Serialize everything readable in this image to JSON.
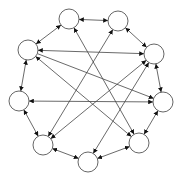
{
  "diagram": {
    "type": "directed-graph",
    "layout": "circular",
    "node_radius": 10,
    "colors": {
      "background": "#ffffff",
      "node_stroke": "#555555",
      "edge": "#444444",
      "arrow": "#111111"
    },
    "nodes": [
      {
        "id": "n1",
        "x": 69,
        "y": 19
      },
      {
        "id": "n2",
        "x": 118,
        "y": 21
      },
      {
        "id": "n3",
        "x": 154,
        "y": 54
      },
      {
        "id": "n4",
        "x": 163,
        "y": 102
      },
      {
        "id": "n5",
        "x": 139,
        "y": 143
      },
      {
        "id": "n6",
        "x": 88,
        "y": 162
      },
      {
        "id": "n7",
        "x": 43,
        "y": 145
      },
      {
        "id": "n8",
        "x": 19,
        "y": 101
      },
      {
        "id": "n9",
        "x": 28,
        "y": 50
      }
    ],
    "edges": [
      {
        "from": "n1",
        "to": "n2",
        "bidirectional": true
      },
      {
        "from": "n2",
        "to": "n3",
        "bidirectional": true
      },
      {
        "from": "n3",
        "to": "n4",
        "bidirectional": true
      },
      {
        "from": "n4",
        "to": "n5",
        "bidirectional": true
      },
      {
        "from": "n5",
        "to": "n6",
        "bidirectional": true
      },
      {
        "from": "n6",
        "to": "n7",
        "bidirectional": true
      },
      {
        "from": "n7",
        "to": "n8",
        "bidirectional": true
      },
      {
        "from": "n8",
        "to": "n9",
        "bidirectional": true
      },
      {
        "from": "n9",
        "to": "n1",
        "bidirectional": true
      },
      {
        "from": "n9",
        "to": "n3",
        "bidirectional": true
      },
      {
        "from": "n9",
        "to": "n4",
        "bidirectional": false
      },
      {
        "from": "n9",
        "to": "n5",
        "bidirectional": true
      },
      {
        "from": "n8",
        "to": "n4",
        "bidirectional": true
      },
      {
        "from": "n3",
        "to": "n7",
        "bidirectional": true
      },
      {
        "from": "n3",
        "to": "n6",
        "bidirectional": true
      },
      {
        "from": "n1",
        "to": "n5",
        "bidirectional": true
      },
      {
        "from": "n2",
        "to": "n7",
        "bidirectional": true
      }
    ]
  }
}
